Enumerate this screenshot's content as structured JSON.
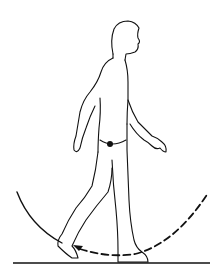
{
  "diagram": {
    "colors": {
      "background": "#ffffff",
      "line": "#111111"
    },
    "elements": {
      "figure": "walking-person-outline",
      "center_of_mass": "filled-dot",
      "solid_arc": "left arc (solid)",
      "dashed_arc": "right arc (dashed) with arrowhead",
      "ground": "ground-line"
    }
  }
}
